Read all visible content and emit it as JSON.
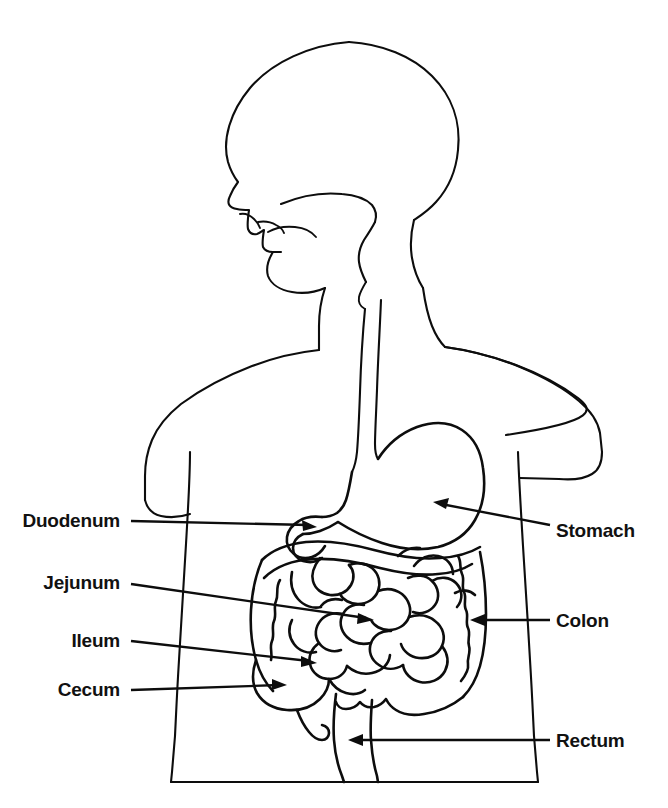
{
  "figure": {
    "kind": "anatomical-line-diagram",
    "orientation": "head in left profile, body facing left",
    "background_color": "#ffffff",
    "line_color": "#0d0d0d",
    "text_color": "#111111"
  },
  "labels": {
    "left": [
      {
        "id": "duodenum",
        "text": "Duodenum",
        "x": 120,
        "y": 520,
        "arrow_tip": [
          315,
          527
        ]
      },
      {
        "id": "jejunum",
        "text": "Jejunum",
        "x": 120,
        "y": 582,
        "arrow_tip": [
          372,
          620
        ]
      },
      {
        "id": "ileum",
        "text": "Ileum",
        "x": 120,
        "y": 640,
        "arrow_tip": [
          315,
          663
        ]
      },
      {
        "id": "cecum",
        "text": "Cecum",
        "x": 120,
        "y": 682,
        "arrow_tip": [
          285,
          686
        ]
      }
    ],
    "right": [
      {
        "id": "stomach",
        "text": "Stomach",
        "x": 556,
        "y": 521,
        "arrow_tip": [
          435,
          502
        ]
      },
      {
        "id": "colon",
        "text": "Colon",
        "x": 556,
        "y": 612,
        "arrow_tip": [
          470,
          620
        ]
      },
      {
        "id": "rectum",
        "text": "Rectum",
        "x": 556,
        "y": 728,
        "arrow_tip": [
          348,
          740
        ]
      }
    ]
  },
  "organs": [
    "mouth",
    "tongue",
    "pharynx",
    "esophagus",
    "stomach",
    "duodenum",
    "jejunum",
    "ileum",
    "cecum",
    "appendix",
    "colon",
    "rectum"
  ]
}
